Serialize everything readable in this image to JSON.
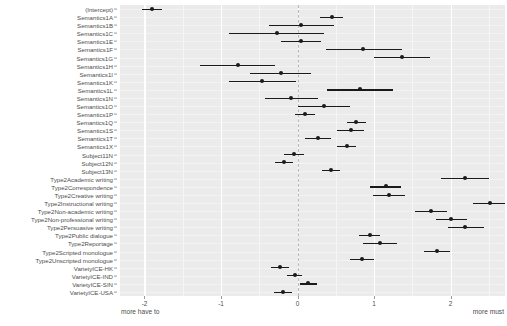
{
  "chart_data": {
    "type": "scatter",
    "title": "",
    "subtitle": "",
    "xlabel": "",
    "ylabel": "",
    "xlim": [
      -2.32,
      2.71
    ],
    "ylim_categories_order": "top-to-bottom",
    "grid": true,
    "legend": null,
    "zero_reference_line": 0,
    "xticks": [
      -2,
      -1,
      0,
      1,
      2
    ],
    "xtick_labels": [
      "-2",
      "-1",
      "0",
      "1",
      "2"
    ],
    "annotations": {
      "left": "more have to",
      "right": "more must"
    },
    "point_color": "#1a1a1a",
    "panel_color": "#ebebeb",
    "grid_color": "#ffffff",
    "estimate_label": "estimate",
    "ci_label": "95% CI",
    "categories": [
      "(Intercept)",
      "Semantics1A",
      "Semantics1B",
      "Semantics1C",
      "Semantics1E",
      "Semantics1F",
      "Semantics1G",
      "Semantics1H",
      "Semantics1I",
      "Semantics1K",
      "Semantics1L",
      "Semantics1N",
      "Semantics1O",
      "Semantics1P",
      "Semantics1Q",
      "Semantics1S",
      "Semantics1T",
      "Semantics1X",
      "Subject11N",
      "Subject12N",
      "Subject13N",
      "Type2Academic writing",
      "Type2Correspondence",
      "Type2Creative writing",
      "Type2Instructional writing",
      "Type2Non-academic writing",
      "Type2Non-professional writing",
      "Type2Persuasive writing",
      "Type2Public dialogue",
      "Type2Reportage",
      "Type2Scripted monologue",
      "Type2Unscripted monologue",
      "VarietyICE-HK",
      "VarietyICE-IND",
      "VarietyICE-SIN",
      "VarietyICE-USA"
    ],
    "estimates": [
      -1.9,
      0.45,
      0.05,
      -0.27,
      0.04,
      0.86,
      1.36,
      -0.78,
      -0.22,
      -0.46,
      0.82,
      -0.08,
      0.34,
      0.1,
      0.76,
      0.7,
      0.27,
      0.64,
      -0.05,
      -0.18,
      0.44,
      2.19,
      1.15,
      1.2,
      2.52,
      1.74,
      2.01,
      2.19,
      0.94,
      1.08,
      1.82,
      0.84,
      -0.23,
      -0.04,
      0.14,
      -0.19
    ],
    "ci_low": [
      -2.03,
      0.29,
      -0.37,
      -0.9,
      -0.22,
      0.37,
      1.0,
      -1.28,
      -0.62,
      -0.9,
      0.39,
      -0.43,
      0.0,
      -0.03,
      0.64,
      0.52,
      0.1,
      0.52,
      -0.18,
      -0.3,
      0.32,
      1.87,
      0.94,
      0.99,
      2.29,
      1.53,
      1.81,
      1.96,
      0.8,
      0.86,
      1.65,
      0.68,
      -0.35,
      -0.14,
      0.03,
      -0.31
    ],
    "ci_high": [
      -1.77,
      0.6,
      0.48,
      0.35,
      0.3,
      1.36,
      1.73,
      -0.29,
      0.18,
      -0.02,
      1.25,
      0.27,
      0.68,
      0.23,
      0.89,
      0.87,
      0.44,
      0.76,
      0.08,
      -0.06,
      0.56,
      2.5,
      1.35,
      1.41,
      2.74,
      1.95,
      2.21,
      2.43,
      1.08,
      1.3,
      1.99,
      1.0,
      -0.11,
      0.06,
      0.26,
      -0.07
    ]
  }
}
